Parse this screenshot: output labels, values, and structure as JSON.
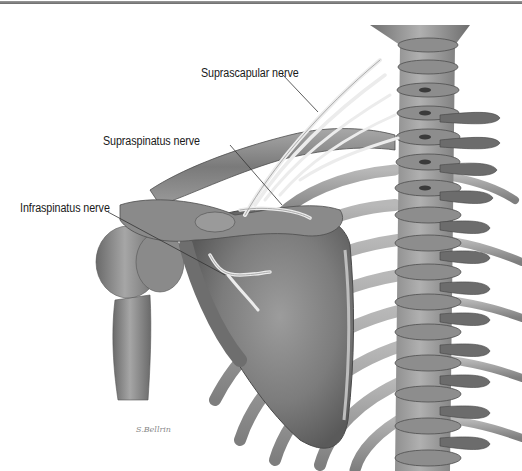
{
  "figure": {
    "labels": [
      {
        "id": "suprascapular",
        "text": "Suprascapular nerve"
      },
      {
        "id": "supraspinatus",
        "text": "Supraspinatus nerve"
      },
      {
        "id": "infraspinatus",
        "text": "Infraspinatus nerve"
      }
    ],
    "signature": "S.Bellrin",
    "colors": {
      "bone_dark": "#5e5e5e",
      "bone_mid": "#8c8c8c",
      "bone_light": "#c4c4c4",
      "nerve": "#ececec",
      "leader_line": "#333333",
      "text": "#1a1a1a"
    }
  }
}
